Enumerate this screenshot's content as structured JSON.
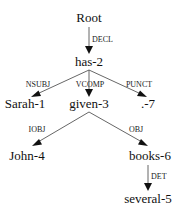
{
  "diagram": {
    "type": "dependency-tree",
    "nodes": {
      "root": "Root",
      "has": "has-2",
      "sarah": "Sarah-1",
      "given": "given-3",
      "punct": ".-7",
      "john": "John-4",
      "books": "books-6",
      "several": "several-5"
    },
    "edges": {
      "root_has": "DECL",
      "has_sarah": "NSUBJ",
      "has_given": "VCOMP",
      "has_punct": "PUNCT",
      "given_john": "IOBJ",
      "given_books": "OBJ",
      "books_several": "DET"
    },
    "colors": {
      "text": "#111111",
      "edge": "#555555",
      "background": "#ffffff"
    }
  }
}
